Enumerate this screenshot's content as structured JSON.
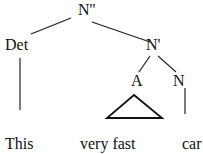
{
  "tree": {
    "root": "N''",
    "det": "Det",
    "nbar": "N'",
    "adj": "A",
    "noun": "N"
  },
  "words": {
    "det_word": "This",
    "adj_phrase": "very fast",
    "noun_word": "car"
  }
}
